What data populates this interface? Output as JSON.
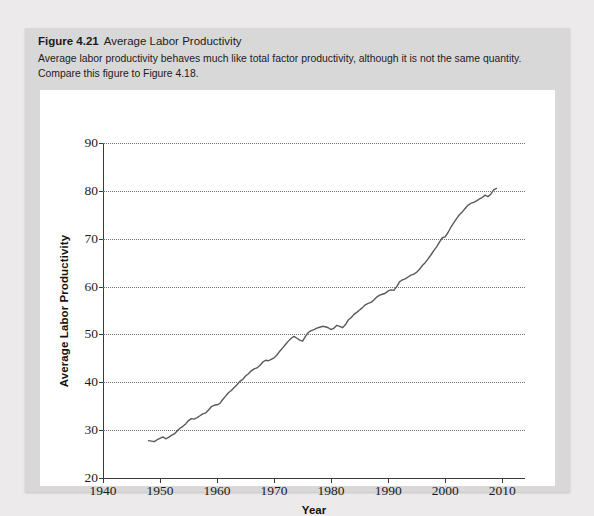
{
  "caption": {
    "figure_number": "Figure 4.21",
    "figure_title": "Average Labor Productivity",
    "description": "Average labor productivity behaves much like total factor productivity, although it is not the same quantity. Compare this figure to Figure 4.18."
  },
  "chart_data": {
    "type": "line",
    "title": "Average Labor Productivity",
    "xlabel": "Year",
    "ylabel": "Average Labor Productivity",
    "xlim": [
      1940,
      2014
    ],
    "ylim": [
      20,
      90
    ],
    "xticks": [
      1940,
      1950,
      1960,
      1970,
      1980,
      1990,
      2000,
      2010
    ],
    "yticks": [
      20,
      30,
      40,
      50,
      60,
      70,
      80,
      90
    ],
    "grid": "horizontal-dotted",
    "legend": "none",
    "line_color": "#595959",
    "series": [
      {
        "name": "Average Labor Productivity",
        "x": [
          1948,
          1948.5,
          1949,
          1949.5,
          1950,
          1950.5,
          1951,
          1951.5,
          1952,
          1952.5,
          1953,
          1953.5,
          1954,
          1954.5,
          1955,
          1955.5,
          1956,
          1956.5,
          1957,
          1957.5,
          1958,
          1958.5,
          1959,
          1959.5,
          1960,
          1960.5,
          1961,
          1961.5,
          1962,
          1962.5,
          1963,
          1963.5,
          1964,
          1964.5,
          1965,
          1965.5,
          1966,
          1966.5,
          1967,
          1967.5,
          1968,
          1968.5,
          1969,
          1969.5,
          1970,
          1970.5,
          1971,
          1971.5,
          1972,
          1972.5,
          1973,
          1973.5,
          1974,
          1974.5,
          1975,
          1975.5,
          1976,
          1976.5,
          1977,
          1977.5,
          1978,
          1978.5,
          1979,
          1979.5,
          1980,
          1980.5,
          1981,
          1981.5,
          1982,
          1982.5,
          1983,
          1983.5,
          1984,
          1984.5,
          1985,
          1985.5,
          1986,
          1986.5,
          1987,
          1987.5,
          1988,
          1988.5,
          1989,
          1989.5,
          1990,
          1990.5,
          1991,
          1991.5,
          1992,
          1992.5,
          1993,
          1993.5,
          1994,
          1994.5,
          1995,
          1995.5,
          1996,
          1996.5,
          1997,
          1997.5,
          1998,
          1998.5,
          1999,
          1999.5,
          2000,
          2000.5,
          2001,
          2001.5,
          2002,
          2002.5,
          2003,
          2003.5,
          2004,
          2004.5,
          2005,
          2005.5,
          2006,
          2006.5,
          2007,
          2007.5,
          2008,
          2008.5,
          2009
        ],
        "y": [
          27.8,
          27.7,
          27.6,
          28.0,
          28.3,
          28.6,
          28.2,
          28.5,
          28.9,
          29.2,
          29.8,
          30.4,
          30.8,
          31.3,
          32.0,
          32.4,
          32.3,
          32.6,
          33.0,
          33.4,
          33.6,
          34.2,
          34.9,
          35.2,
          35.3,
          35.6,
          36.4,
          37.1,
          37.8,
          38.3,
          38.9,
          39.5,
          40.2,
          40.6,
          41.3,
          41.8,
          42.4,
          42.8,
          43.0,
          43.5,
          44.2,
          44.6,
          44.5,
          44.8,
          45.1,
          45.7,
          46.5,
          47.2,
          47.9,
          48.6,
          49.2,
          49.6,
          49.2,
          48.8,
          48.6,
          49.6,
          50.4,
          50.8,
          51.0,
          51.3,
          51.5,
          51.7,
          51.6,
          51.4,
          51.0,
          51.3,
          51.9,
          51.7,
          51.4,
          52.0,
          53.0,
          53.5,
          54.2,
          54.6,
          55.1,
          55.6,
          56.2,
          56.5,
          56.7,
          57.2,
          57.8,
          58.2,
          58.4,
          58.6,
          59.1,
          59.3,
          59.2,
          60.0,
          61.0,
          61.4,
          61.6,
          62.0,
          62.4,
          62.6,
          63.0,
          63.6,
          64.4,
          65.0,
          65.8,
          66.6,
          67.5,
          68.3,
          69.3,
          70.2,
          70.4,
          71.3,
          72.4,
          73.3,
          74.2,
          75.0,
          75.6,
          76.3,
          77.0,
          77.4,
          77.6,
          77.9,
          78.3,
          78.6,
          79.1,
          78.8,
          79.3,
          80.2,
          80.5
        ]
      }
    ]
  }
}
